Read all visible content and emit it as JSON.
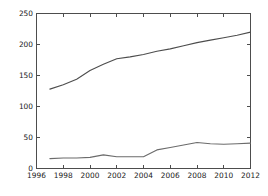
{
  "chart_data": {
    "type": "line",
    "title": "",
    "subtitle": "",
    "xlabel": "",
    "ylabel": "",
    "xlim": [
      1996,
      2012
    ],
    "ylim": [
      0,
      250
    ],
    "grid": false,
    "legend": "none",
    "xticks": [
      "1996",
      "1998",
      "2000",
      "2002",
      "2004",
      "2006",
      "2008",
      "2010",
      "2012"
    ],
    "xtick_values": [
      1996,
      1998,
      2000,
      2002,
      2004,
      2006,
      2008,
      2010,
      2012
    ],
    "yticks": [
      "0",
      "50",
      "100",
      "150",
      "200",
      "250"
    ],
    "ytick_values": [
      0,
      50,
      100,
      150,
      200,
      250
    ],
    "x": [
      1997,
      1998,
      1999,
      2000,
      2001,
      2002,
      2003,
      2004,
      2005,
      2006,
      2007,
      2008,
      2009,
      2010,
      2011,
      2012
    ],
    "series": [
      {
        "name": "upper-series",
        "color": "#4d4d4d",
        "values": [
          128,
          135,
          144,
          158,
          168,
          177,
          180,
          184,
          189,
          193,
          198,
          203,
          207,
          211,
          215,
          220
        ]
      },
      {
        "name": "lower-series",
        "color": "#6b6b6b",
        "values": [
          16,
          17,
          17,
          18,
          22,
          19,
          19,
          19,
          30,
          34,
          38,
          42,
          40,
          39,
          40,
          41
        ]
      }
    ]
  },
  "axes": {
    "x_axis_name": "year-axis",
    "y_axis_name": "value-axis"
  }
}
